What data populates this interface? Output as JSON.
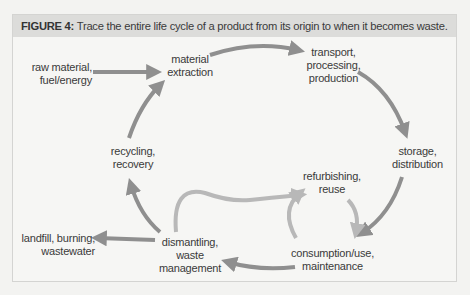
{
  "figure": {
    "label": "FIGURE 4:",
    "caption": " Trace the entire life cycle of a product from its origin to when it becomes waste."
  },
  "colors": {
    "arrow_dark": "#8f8f8f",
    "arrow_light": "#b8b8b8",
    "caption_bg": "#dcdcda",
    "text": "#3a3a3a"
  },
  "nodes": {
    "raw_material": {
      "lines": [
        "raw material,",
        "fuel/energy"
      ]
    },
    "material_extraction": {
      "lines": [
        "material",
        "extraction"
      ]
    },
    "transport": {
      "lines": [
        "transport,",
        "processing,",
        "production"
      ]
    },
    "storage": {
      "lines": [
        "storage,",
        "distribution"
      ]
    },
    "refurbishing": {
      "lines": [
        "refurbishing,",
        "reuse"
      ]
    },
    "consumption": {
      "lines": [
        "consumption/use,",
        "maintenance"
      ]
    },
    "dismantling": {
      "lines": [
        "dismantling,",
        "waste",
        "management"
      ]
    },
    "recycling": {
      "lines": [
        "recycling,",
        "recovery"
      ]
    },
    "landfill": {
      "lines": [
        "landfill, burning,",
        "wastewater"
      ]
    }
  },
  "flows": [
    {
      "from": "raw material, fuel/energy",
      "to": "material extraction"
    },
    {
      "from": "material extraction",
      "to": "transport, processing, production"
    },
    {
      "from": "transport, processing, production",
      "to": "storage, distribution"
    },
    {
      "from": "storage, distribution",
      "to": "consumption/use, maintenance"
    },
    {
      "from": "consumption/use, maintenance",
      "to": "dismantling, waste management"
    },
    {
      "from": "dismantling, waste management",
      "to": "recycling, recovery"
    },
    {
      "from": "recycling, recovery",
      "to": "material extraction"
    },
    {
      "from": "dismantling, waste management",
      "to": "landfill, burning, wastewater"
    },
    {
      "from": "dismantling, waste management",
      "to": "refurbishing, reuse"
    },
    {
      "from": "consumption/use, maintenance",
      "to": "refurbishing, reuse"
    },
    {
      "from": "refurbishing, reuse",
      "to": "consumption/use, maintenance"
    }
  ]
}
